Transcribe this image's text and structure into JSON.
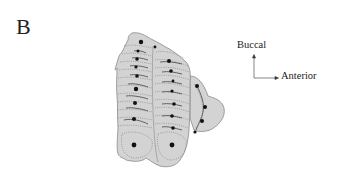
{
  "figure": {
    "panel_label": "B",
    "orientation": {
      "vertical_label": "Buccal",
      "horizontal_label": "Anterior"
    },
    "colors": {
      "tooth_fill": "#d3d3d3",
      "outline": "#8a8a8a",
      "dotted_lines": "#7a7a7a",
      "cusp_dots": "#111111",
      "ridge_lines": "#555555"
    }
  }
}
